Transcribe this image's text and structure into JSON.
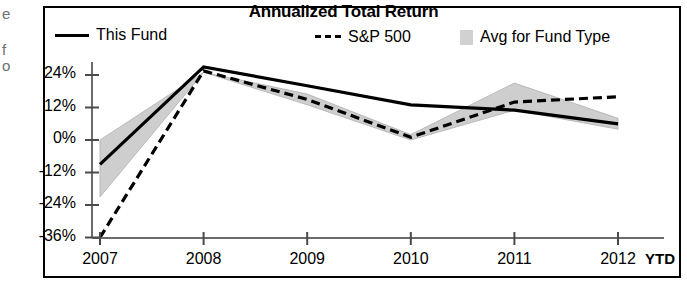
{
  "chart_data": {
    "type": "line",
    "title": "Annualized Total Return",
    "xlabel": "",
    "ylabel": "",
    "x": [
      "2007",
      "2008",
      "2009",
      "2010",
      "2011",
      "2012"
    ],
    "categories": [
      "2007",
      "2008",
      "2009",
      "2010",
      "2011",
      "2012"
    ],
    "x_axis_note": "YTD",
    "ylim": [
      -36,
      30
    ],
    "yticks": [
      24,
      12,
      0,
      -12,
      -24,
      -36
    ],
    "ytick_labels": [
      "24%",
      "12%",
      "0%",
      "-12%",
      "-24%",
      "-36%"
    ],
    "grid": false,
    "legend_position": "top",
    "series": [
      {
        "name": "This Fund",
        "style": "solid-line",
        "values": [
          -9,
          27,
          20,
          13,
          11,
          6
        ]
      },
      {
        "name": "S&P 500",
        "style": "dashed-line",
        "values": [
          -36,
          25.5,
          15,
          1,
          14,
          16
        ]
      },
      {
        "name": "Avg for Fund Type",
        "style": "shaded-band",
        "upper": [
          0,
          25,
          17,
          2,
          21,
          8
        ],
        "lower": [
          -21,
          25,
          13,
          0,
          11,
          4
        ]
      }
    ]
  },
  "chart": {
    "title": "Annualized Total Return",
    "legend": {
      "this_fund": "This Fund",
      "sp500": "S&P 500",
      "avg_fund_type": "Avg for Fund Type"
    },
    "y_ticks": [
      "24%",
      "12%",
      "0%",
      "-12%",
      "-24%",
      "-36%"
    ],
    "x_ticks": [
      "2007",
      "2008",
      "2009",
      "2010",
      "2011",
      "2012"
    ],
    "ytd_label": "YTD"
  },
  "edge_fragments": {
    "a": "e",
    "b": "f",
    "c": "o"
  },
  "colors": {
    "line": "#000000",
    "band_fill": "#c9c9c9",
    "axis": "#5a5a5a",
    "frame": "#000000",
    "background": "#ffffff"
  }
}
